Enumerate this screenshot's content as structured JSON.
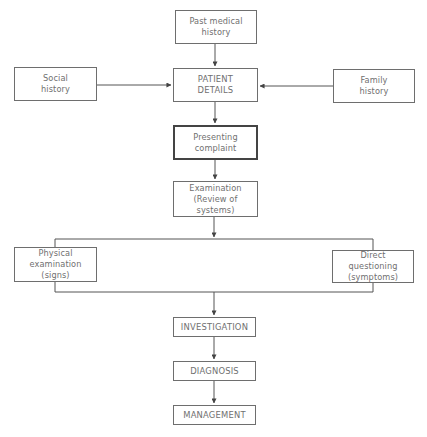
{
  "diagram": {
    "type": "flowchart",
    "nodes": {
      "past_medical_history": {
        "line1": "Past medical",
        "line2": "history"
      },
      "social_history": {
        "line1": "Social",
        "line2": "history"
      },
      "patient_details": {
        "line1": "PATIENT",
        "line2": "DETAILS"
      },
      "family_history": {
        "line1": "Family",
        "line2": "history"
      },
      "presenting_complaint": {
        "line1": "Presenting",
        "line2": "complaint"
      },
      "examination": {
        "line1": "Examination",
        "line2": "(Review of systems)"
      },
      "physical_examination": {
        "line1": "Physical",
        "line2": "examination (signs)"
      },
      "direct_questioning": {
        "line1": "Direct questioning",
        "line2": "(symptoms)"
      },
      "investigation": {
        "label": "INVESTIGATION"
      },
      "diagnosis": {
        "label": "DIAGNOSIS"
      },
      "management": {
        "label": "MANAGEMENT"
      }
    },
    "edges": [
      {
        "from": "Past medical history",
        "to": "PATIENT DETAILS"
      },
      {
        "from": "Social history",
        "to": "PATIENT DETAILS"
      },
      {
        "from": "Family history",
        "to": "PATIENT DETAILS"
      },
      {
        "from": "PATIENT DETAILS",
        "to": "Presenting complaint"
      },
      {
        "from": "Presenting complaint",
        "to": "Examination (Review of systems)"
      },
      {
        "from": "Examination (Review of systems)",
        "to": "Physical examination (signs) / Direct questioning (symptoms)"
      },
      {
        "from": "Physical examination (signs) / Direct questioning (symptoms)",
        "to": "INVESTIGATION"
      },
      {
        "from": "INVESTIGATION",
        "to": "DIAGNOSIS"
      },
      {
        "from": "DIAGNOSIS",
        "to": "MANAGEMENT"
      }
    ],
    "colors": {
      "line": "#555555",
      "box_border": "#6e6e6e",
      "highlight_border": "#444444",
      "text": "#707070"
    }
  }
}
